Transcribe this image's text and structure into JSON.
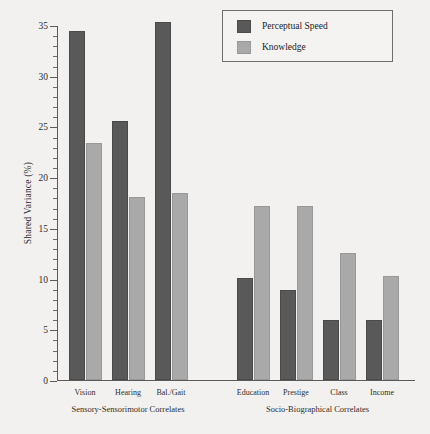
{
  "chart_data": {
    "type": "bar",
    "title": "",
    "xlabel": "",
    "ylabel": "Shared Variance (%)",
    "ylim": [
      0,
      35
    ],
    "grid": false,
    "legend_position": "top-right",
    "categories": [
      "Vision",
      "Hearing",
      "Bal./Gait",
      "Education",
      "Prestige",
      "Class",
      "Income"
    ],
    "groups": [
      {
        "label": "Sensory-Sensorimotor Correlates",
        "categories": [
          "Vision",
          "Hearing",
          "Bal./Gait"
        ]
      },
      {
        "label": "Socio-Biographical Correlates",
        "categories": [
          "Education",
          "Prestige",
          "Class",
          "Income"
        ]
      }
    ],
    "series": [
      {
        "name": "Perceptual Speed",
        "color": "#595959",
        "values": [
          34.4,
          25.5,
          35.3,
          10.1,
          8.9,
          5.9,
          5.9
        ]
      },
      {
        "name": "Knowledge",
        "color": "#a9a9a9",
        "values": [
          23.4,
          18.0,
          18.4,
          17.2,
          17.2,
          12.5,
          10.3
        ]
      }
    ],
    "y_ticks_major": [
      0,
      5,
      10,
      15,
      20,
      25,
      30,
      35
    ],
    "y_tick_labels": [
      "0",
      "5",
      "10",
      "15",
      "20",
      "25",
      "30",
      "35"
    ],
    "y_ticks_minor": [
      1,
      2,
      3,
      4,
      6,
      7,
      8,
      9,
      11,
      12,
      13,
      14,
      16,
      17,
      18,
      19,
      21,
      22,
      23,
      24,
      26,
      27,
      28,
      29,
      31,
      32,
      33,
      34
    ]
  },
  "legend": {
    "items": [
      {
        "label": "Perceptual Speed",
        "swatch": "ps"
      },
      {
        "label": "Knowledge",
        "swatch": "kn"
      }
    ]
  },
  "axis": {
    "y_label": "Shared Variance (%)"
  }
}
